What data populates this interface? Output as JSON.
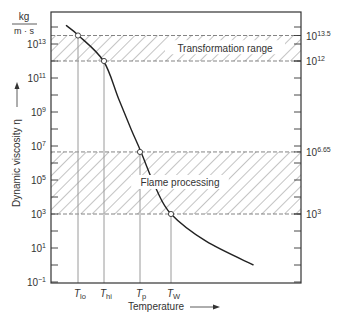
{
  "chart_data": {
    "type": "line",
    "title": "",
    "xlabel": "Temperature",
    "ylabel": "Dynamic viscosity η",
    "yunit": {
      "numerator": "kg",
      "denominator": "m · s"
    },
    "yscale": "log",
    "ylim_exp": [
      -1,
      14.5
    ],
    "left_ticks": [
      {
        "exp": 13,
        "label": "10",
        "sup": "13"
      },
      {
        "exp": 11,
        "label": "10",
        "sup": "11"
      },
      {
        "exp": 9,
        "label": "10",
        "sup": "9"
      },
      {
        "exp": 7,
        "label": "10",
        "sup": "7"
      },
      {
        "exp": 5,
        "label": "10",
        "sup": "5"
      },
      {
        "exp": 3,
        "label": "10",
        "sup": "3"
      },
      {
        "exp": 1,
        "label": "10",
        "sup": "1"
      },
      {
        "exp": -1,
        "label": "10",
        "sup": "−1"
      }
    ],
    "right_ticks": [
      {
        "exp": 13.5,
        "label": "10",
        "sup": "13.5"
      },
      {
        "exp": 12,
        "label": "10",
        "sup": "12"
      },
      {
        "exp": 6.65,
        "label": "10",
        "sup": "6.65"
      },
      {
        "exp": 3,
        "label": "10",
        "sup": "3"
      }
    ],
    "x_markers": [
      {
        "name": "T_lo",
        "base": "T",
        "sub": "lo",
        "viscosity_exp": 13.5
      },
      {
        "name": "T_hi",
        "base": "T",
        "sub": "hi",
        "viscosity_exp": 12
      },
      {
        "name": "T_p",
        "base": "T",
        "sub": "p",
        "viscosity_exp": 6.65
      },
      {
        "name": "T_W",
        "base": "T",
        "sub": "W",
        "viscosity_exp": 3
      }
    ],
    "bands": [
      {
        "label": "Transformation range",
        "from_exp": 12,
        "to_exp": 13.5
      },
      {
        "label": "Flame processing",
        "from_exp": 3,
        "to_exp": 6.65
      }
    ],
    "series": [
      {
        "name": "Viscosity curve",
        "points_rel": [
          {
            "t": 0.06,
            "exp": 14.1
          },
          {
            "t": 0.11,
            "exp": 13.5
          },
          {
            "t": 0.21,
            "exp": 12
          },
          {
            "t": 0.27,
            "exp": 9.8
          },
          {
            "t": 0.32,
            "exp": 8.0
          },
          {
            "t": 0.36,
            "exp": 6.65
          },
          {
            "t": 0.42,
            "exp": 4.5
          },
          {
            "t": 0.48,
            "exp": 3
          },
          {
            "t": 0.62,
            "exp": 1.4
          },
          {
            "t": 0.81,
            "exp": 0.0
          }
        ]
      }
    ],
    "grid": false,
    "legend": "none"
  },
  "colors": {
    "axis": "#333333",
    "curve": "#222222",
    "hatch": "#8a8a8a",
    "marker_line": "#9a9a9a"
  }
}
